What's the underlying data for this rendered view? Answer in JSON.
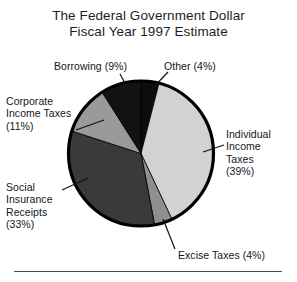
{
  "title": {
    "line1": "The Federal Government Dollar",
    "line2": "Fiscal Year 1997 Estimate"
  },
  "labels": {
    "borrowing": "Borrowing (9%)",
    "other": "Other (4%)",
    "corporate": "Corporate\nIncome Taxes\n(11%)",
    "individual": "Individual\nIncome\nTaxes\n(39%)",
    "social": "Social\nInsurance\nReceipts\n(33%)",
    "excise": "Excise Taxes (4%)"
  },
  "chart_data": {
    "type": "pie",
    "title": "The Federal Government Dollar Fiscal Year 1997 Estimate",
    "categories": [
      "Other",
      "Individual Income Taxes",
      "Excise Taxes",
      "Social Insurance Receipts",
      "Corporate Income Taxes",
      "Borrowing"
    ],
    "values": [
      4,
      39,
      4,
      33,
      11,
      9
    ],
    "unit": "percent",
    "total": 100,
    "start_angle_deg": 0,
    "direction": "clockwise",
    "legend": "none",
    "labels_position": "outside-with-leader-lines",
    "colors": [
      "#0d0d0d",
      "#d2d2d2",
      "#8f8f8f",
      "#3a3a3a",
      "#9a9a9a",
      "#121212"
    ],
    "slices": [
      {
        "name": "Other",
        "value": 4,
        "label": "Other (4%)",
        "color": "#0d0d0d"
      },
      {
        "name": "Individual Income Taxes",
        "value": 39,
        "label": "Individual Income Taxes (39%)",
        "color": "#d2d2d2"
      },
      {
        "name": "Excise Taxes",
        "value": 4,
        "label": "Excise Taxes (4%)",
        "color": "#8f8f8f"
      },
      {
        "name": "Social Insurance Receipts",
        "value": 33,
        "label": "Social Insurance Receipts (33%)",
        "color": "#3a3a3a"
      },
      {
        "name": "Corporate Income Taxes",
        "value": 11,
        "label": "Corporate Income Taxes (11%)",
        "color": "#9a9a9a"
      },
      {
        "name": "Borrowing",
        "value": 9,
        "label": "Borrowing (9%)",
        "color": "#121212"
      }
    ]
  },
  "style": {
    "background": "#ffffff",
    "outline": "#000000",
    "text": "#161616",
    "rule": "#4a4a4a"
  }
}
